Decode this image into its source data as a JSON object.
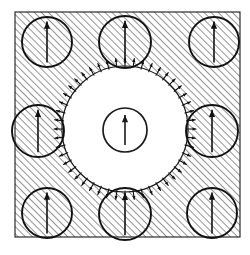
{
  "figure": {
    "canvas": {
      "width": 250,
      "height": 255,
      "background": "#ffffff"
    },
    "matrix": {
      "name": "hatched-matrix-region",
      "x": 15,
      "y": 12,
      "width": 225,
      "height": 225,
      "border_color": "#1a1a1a",
      "border_width": 1.1,
      "hatch": {
        "angle_deg": 45,
        "spacing": 5.0,
        "line_width": 1.0,
        "color": "#2b2b2b"
      }
    },
    "central_domain": {
      "name": "central-white-domain",
      "cx": 125,
      "cy": 129,
      "r": 63,
      "fill": "#ffffff",
      "outline_color": "#1a1a1a",
      "outline_width": 1.2,
      "boundary_arrows": {
        "count": 48,
        "length": 9,
        "head_size": 3.0,
        "line_width": 1.1,
        "color": "#111111",
        "direction": "outward-radial"
      }
    },
    "center_particle": {
      "name": "center-inclusion",
      "cx": 125,
      "cy": 130,
      "r": 22,
      "outline_color": "#1a1a1a",
      "outline_width": 1.7,
      "fill": "none",
      "arrow": {
        "direction": "up",
        "length": 30,
        "head_size": 5.0,
        "line_width": 1.6
      }
    },
    "inclusions": [
      {
        "name": "inclusion-top-left",
        "cx": 47,
        "cy": 42,
        "r": 25
      },
      {
        "name": "inclusion-top-center",
        "cx": 125,
        "cy": 42,
        "r": 26
      },
      {
        "name": "inclusion-top-right",
        "cx": 214,
        "cy": 42,
        "r": 25
      },
      {
        "name": "inclusion-middle-left",
        "cx": 38,
        "cy": 131,
        "r": 26
      },
      {
        "name": "inclusion-middle-right",
        "cx": 212,
        "cy": 131,
        "r": 26
      },
      {
        "name": "inclusion-bottom-left",
        "cx": 47,
        "cy": 213,
        "r": 25
      },
      {
        "name": "inclusion-bottom-center",
        "cx": 125,
        "cy": 214,
        "r": 26
      },
      {
        "name": "inclusion-bottom-right",
        "cx": 212,
        "cy": 213,
        "r": 25
      }
    ],
    "inclusion_style": {
      "outline_color": "#111111",
      "outline_width": 1.9,
      "fill": "none",
      "arrow": {
        "direction": "up",
        "length_ratio": 0.82,
        "head_size": 5.0,
        "line_width": 1.6,
        "color": "#111111"
      }
    }
  }
}
